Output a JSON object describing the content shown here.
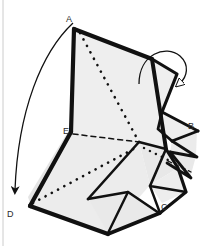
{
  "figure": {
    "kind": "origami-folding-diagram",
    "caption_present": false,
    "background_color": "#ffffff",
    "ink_color": "#111111",
    "paper_fill": "#f0f0f0",
    "paper_fill_shadow": "#e2e2e2",
    "border": {
      "name": "left-frame-rule",
      "color": "#c9c9c9",
      "x": 3,
      "visible": true
    },
    "labels": [
      {
        "id": "A",
        "text": "A",
        "x": 68,
        "y": 19
      },
      {
        "id": "B",
        "text": "B",
        "x": 190,
        "y": 126
      },
      {
        "id": "C",
        "text": "C",
        "x": 163,
        "y": 207
      },
      {
        "id": "D",
        "text": "D",
        "x": 8,
        "y": 214
      },
      {
        "id": "E",
        "text": "E",
        "x": 65,
        "y": 131
      }
    ],
    "arrows": [
      {
        "id": "big-fold-arrow",
        "name": "fold-arrow-a-to-d",
        "from_label": "A",
        "to_label": "D",
        "style": "curved-thin-arrow",
        "direction": "down-left"
      },
      {
        "id": "loop-fold-arrow",
        "name": "fold-arrow-loop-top-right",
        "from_label": "",
        "to_label": "",
        "style": "curved-loop-arrow",
        "direction": "clockwise-down-right"
      }
    ],
    "line_styles": {
      "solid_edge": "visible cut / silhouette edge",
      "dotted_crease": "valley / hidden crease shown as dotted line"
    },
    "creases": [
      {
        "id": "crease-A-center",
        "from": "A",
        "to": "center",
        "style": "dotted"
      },
      {
        "id": "crease-D-center",
        "from": "D",
        "to": "center",
        "style": "dotted"
      },
      {
        "id": "crease-E-center",
        "from": "E",
        "to": "center",
        "style": "dashed"
      },
      {
        "id": "crease-center-right",
        "from": "center",
        "to": "right-edge",
        "style": "dotted"
      }
    ]
  }
}
